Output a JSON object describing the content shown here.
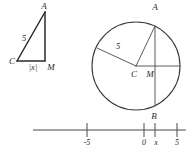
{
  "figure": {
    "ink_color": "#3a3a3a",
    "triangle": {
      "name": "right-triangle-ACM",
      "vertex_a_label": "A",
      "vertex_c_label": "C",
      "vertex_m_label": "M",
      "hypotenuse_label": "5",
      "base_label": "|x|"
    },
    "circle": {
      "name": "circle-centered-at-C",
      "center_label": "C",
      "radius_label": "5",
      "top_point_label": "A",
      "foot_point_label": "M",
      "bottom_point_label": "B"
    },
    "number_line": {
      "name": "number-line",
      "ticks": [
        {
          "label": "-5",
          "value": -5
        },
        {
          "label": "0",
          "value": 0
        },
        {
          "label": "x",
          "value": 1.05
        },
        {
          "label": "5",
          "value": 5
        }
      ]
    }
  }
}
